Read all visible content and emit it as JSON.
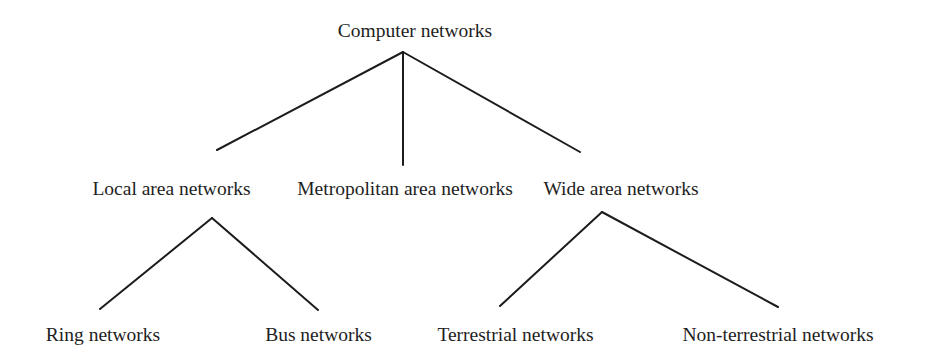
{
  "diagram": {
    "type": "tree",
    "title": "Computer networks",
    "colors": {
      "line": "#1c1c1c",
      "text": "#1e1e1e",
      "background": "#ffffff"
    },
    "nodes": {
      "root": {
        "label": "Computer networks"
      },
      "lan": {
        "label": "Local area networks"
      },
      "man": {
        "label": "Metropolitan area networks"
      },
      "wan": {
        "label": "Wide area networks"
      },
      "ring": {
        "label": "Ring networks"
      },
      "bus": {
        "label": "Bus networks"
      },
      "terrestrial": {
        "label": "Terrestrial networks"
      },
      "non_terrestrial": {
        "label": "Non-terrestrial networks"
      }
    },
    "edges": [
      {
        "from": "Computer networks",
        "to": "Local area networks"
      },
      {
        "from": "Computer networks",
        "to": "Metropolitan area networks"
      },
      {
        "from": "Computer networks",
        "to": "Wide area networks"
      },
      {
        "from": "Local area networks",
        "to": "Ring networks"
      },
      {
        "from": "Local area networks",
        "to": "Bus networks"
      },
      {
        "from": "Wide area networks",
        "to": "Terrestrial networks"
      },
      {
        "from": "Wide area networks",
        "to": "Non-terrestrial networks"
      }
    ]
  }
}
